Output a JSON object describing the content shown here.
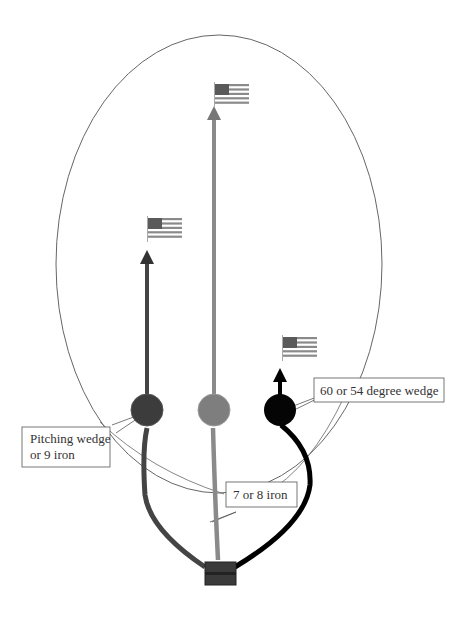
{
  "diagram": {
    "type": "golf-club-shot-trajectory",
    "boundary": {
      "shape": "ellipse",
      "stroke": "#555555"
    },
    "clubs": [
      {
        "id": "pitching",
        "label_lines": [
          "Pitching wedge",
          "or 9 iron"
        ],
        "ball_color": "#3c3c3c",
        "line_color": "#444444",
        "flag": "us-flag-icon"
      },
      {
        "id": "mid-iron",
        "label_lines": [
          "7 or 8 iron"
        ],
        "ball_color": "#7e7e7e",
        "line_color": "#8a8a8a",
        "flag": "us-flag-icon"
      },
      {
        "id": "wedge",
        "label_lines": [
          "60 or 54 degree wedge"
        ],
        "ball_color": "#050505",
        "line_color": "#000000",
        "flag": "us-flag-icon"
      }
    ],
    "origin": {
      "name": "tee-box",
      "color": "#3a3a3a"
    }
  },
  "labels": {
    "pitching_1": "Pitching wedge",
    "pitching_2": "or 9 iron",
    "mid_iron": "7 or 8 iron",
    "wedge": "60 or 54 degree wedge"
  }
}
